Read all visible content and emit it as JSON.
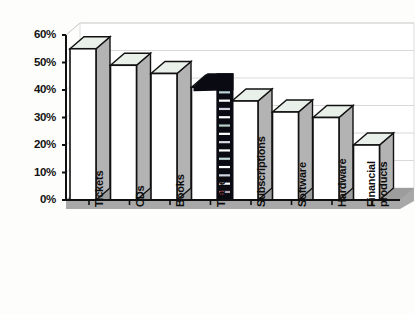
{
  "chart_data": {
    "type": "bar",
    "title": "",
    "subtitle": "",
    "xlabel": "",
    "ylabel": "",
    "categories": [
      "Tickets",
      "CDs",
      "Books",
      "Travel",
      "Subscriptions",
      "Software",
      "Hardware",
      "Financial products"
    ],
    "values": [
      55,
      49,
      46,
      41,
      36,
      32,
      30,
      20
    ],
    "value_suffix": "%",
    "ylim": [
      0,
      60
    ],
    "ytick_values": [
      0,
      10,
      20,
      30,
      40,
      50,
      60
    ],
    "ytick_labels": [
      "0%",
      "10%",
      "20%",
      "30%",
      "40%",
      "50%",
      "60%"
    ],
    "grid": true,
    "grid_axis": "y",
    "legend": false,
    "legend_position": "none",
    "style": "3d-column",
    "orientation": "vertical",
    "xtick_label_rotation": -90,
    "annotations": [
      {
        "name": "scan-artifact-stripe",
        "description": "dark vertical dashed stripe overlapping the right side face of the Travel column"
      }
    ]
  },
  "colors": {
    "bar_front": "#ffffff",
    "bar_side": "#b3b3b3",
    "bar_top": "#e9efe9",
    "bar_outline": "#111111",
    "floor": "#a8a8a8",
    "back_wall": "#ffffff",
    "grid_line": "#cfcfcf",
    "axis_line": "#0f0f0f",
    "text": "#111111",
    "artifact": "#0a0a12"
  },
  "geometry": {
    "plot_left": 66,
    "plot_right": 400,
    "baseline_y": 200,
    "top_y": 35,
    "depth_x": 14,
    "depth_y": 12,
    "bar_width": 26,
    "bar_slot": 40.5,
    "first_bar_x": 70
  }
}
